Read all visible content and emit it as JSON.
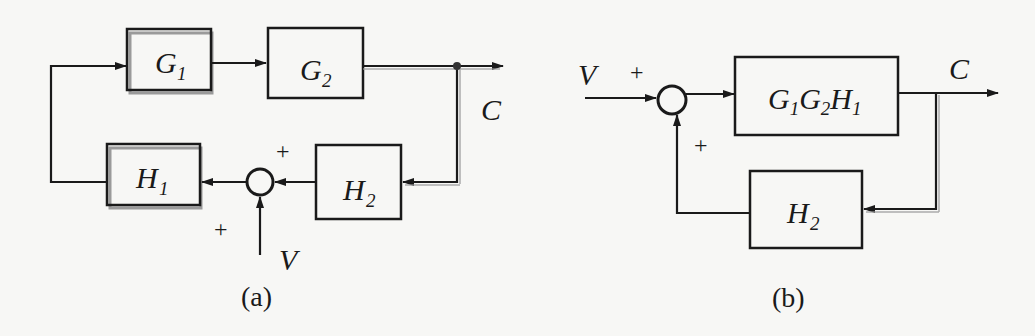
{
  "diagram_a": {
    "caption": "(a)",
    "blocks": {
      "g1": {
        "label": "G",
        "sub": "1"
      },
      "g2": {
        "label": "G",
        "sub": "2"
      },
      "h1": {
        "label": "H",
        "sub": "1"
      },
      "h2": {
        "label": "H",
        "sub": "2"
      }
    },
    "signals": {
      "output": "C",
      "input": "V"
    },
    "summing_signs": {
      "from_h2": "+",
      "from_v": "+"
    }
  },
  "diagram_b": {
    "caption": "(b)",
    "blocks": {
      "forward": {
        "parts": [
          {
            "label": "G",
            "sub": "1"
          },
          {
            "label": "G",
            "sub": "2"
          },
          {
            "label": "H",
            "sub": "1"
          }
        ]
      },
      "h2": {
        "label": "H",
        "sub": "2"
      }
    },
    "signals": {
      "output": "C",
      "input": "V"
    },
    "summing_signs": {
      "from_v": "+",
      "from_h2": "+"
    }
  },
  "colors": {
    "line": "#1a1a1a",
    "shadow": "#9a9a9a",
    "background": "#f7f7f5"
  }
}
